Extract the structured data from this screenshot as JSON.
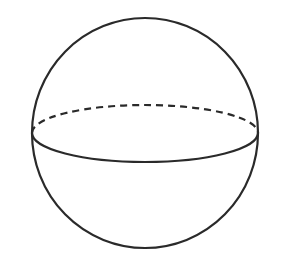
{
  "diagram": {
    "type": "sphere",
    "stroke_color": "#2a2a2a",
    "background": "#ffffff",
    "outline": {
      "cx": 145,
      "cy": 133,
      "rx": 113,
      "ry": 115
    },
    "equator": {
      "cx": 145,
      "cy": 133,
      "rx": 113,
      "ry": 29,
      "front_style": "solid",
      "back_style": "dashed"
    }
  }
}
